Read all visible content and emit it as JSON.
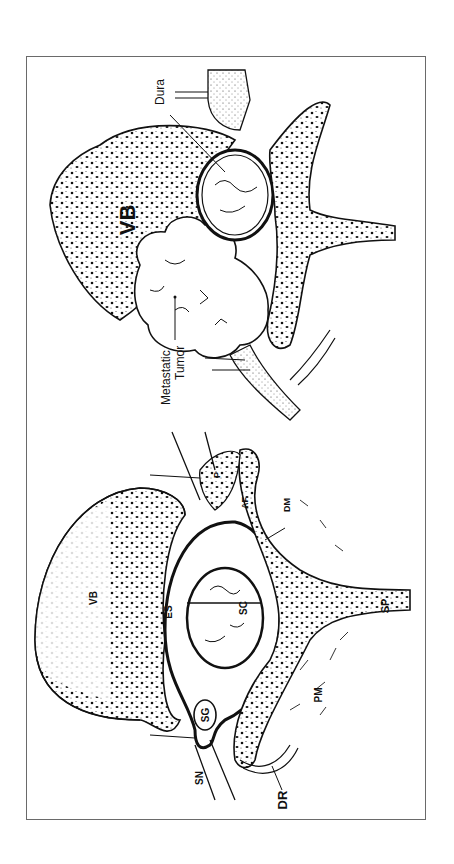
{
  "figure": {
    "orientation": "rotated 90 degrees counterclockwise",
    "frame_border_color": "#6a6a6a",
    "panels": [
      {
        "id": "metastatic",
        "description": "Spinal cross-section with metastatic tumor compressing the thecal sac",
        "labels": {
          "vertebral_body": "VB",
          "dura": "Dura",
          "tumor_line1": "Metastatic",
          "tumor_line2": "Tumor"
        }
      },
      {
        "id": "normal",
        "description": "Normal spinal cross-section anatomy",
        "labels": {
          "vertebral_body": "VB",
          "spinal_cord": "SC",
          "epidural_space": "ES",
          "spinal_ganglion": "SG",
          "spinal_nerve": "SN",
          "dorsal_ramus": "DR",
          "paraspinal_muscle": "PM",
          "spinous_process": "SP",
          "dura_mater": "DM",
          "pedicle": "P",
          "lamina": "AF"
        }
      }
    ]
  }
}
